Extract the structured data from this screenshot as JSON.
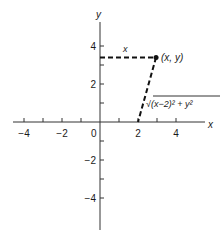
{
  "diagram": {
    "axes": {
      "x_label": "x",
      "y_label": "y",
      "origin_label": "0",
      "x_range": [
        -5,
        5
      ],
      "y_range": [
        -5,
        5
      ],
      "x_tick_labels": [
        {
          "value": -4,
          "label": "−4"
        },
        {
          "value": -2,
          "label": "−2"
        },
        {
          "value": 2,
          "label": "2"
        },
        {
          "value": 4,
          "label": "4"
        }
      ],
      "y_tick_labels": [
        {
          "value": 4,
          "label": "4"
        },
        {
          "value": 2,
          "label": "2"
        },
        {
          "value": -2,
          "label": "−2"
        },
        {
          "value": -4,
          "label": "−4"
        }
      ],
      "x_minor_ticks": [
        -4,
        -3,
        -2,
        -1,
        1,
        2,
        3,
        4
      ],
      "y_minor_ticks": [
        -4,
        -3,
        -2,
        -1,
        1,
        2,
        3,
        4
      ]
    },
    "point": {
      "x": 2.95,
      "y": 3.4,
      "label": "(x, y)"
    },
    "focus": {
      "x": 2,
      "y": 0
    },
    "horizontal_segment_label": "x",
    "slanted_segment_label": "√(x−2)² + y²"
  }
}
